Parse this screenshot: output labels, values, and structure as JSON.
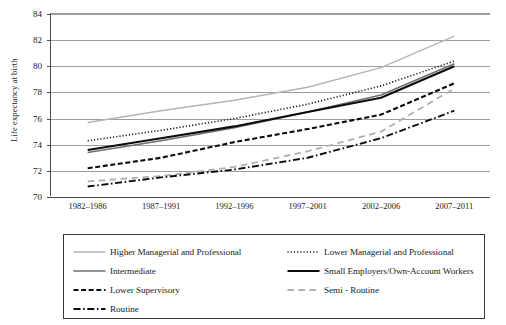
{
  "chart_data": {
    "type": "line",
    "title": "",
    "xlabel": "",
    "ylabel": "Life expectancy at birth",
    "ylim": [
      70,
      84
    ],
    "yticks": [
      70,
      72,
      74,
      76,
      78,
      80,
      82,
      84
    ],
    "grid": true,
    "legend_position": "bottom",
    "categories": [
      "1982–1986",
      "1987–1991",
      "1992–1996",
      "1997–2001",
      "2002–2006",
      "2007–2011"
    ],
    "series": [
      {
        "name": "Higher Managerial and Professional",
        "style": "solid",
        "color": "#b5b5b5",
        "width": 1.4,
        "values": [
          75.7,
          76.6,
          77.4,
          78.4,
          79.9,
          82.3
        ]
      },
      {
        "name": "Lower Managerial and Professional",
        "style": "dotted",
        "color": "#1a1a1a",
        "width": 1.6,
        "values": [
          74.3,
          75.1,
          76.0,
          77.1,
          78.5,
          80.4
        ]
      },
      {
        "name": "Intermediate",
        "style": "solid",
        "color": "#6e6e6e",
        "width": 1.6,
        "values": [
          73.4,
          74.3,
          75.3,
          76.5,
          77.8,
          80.2
        ]
      },
      {
        "name": "Small Employers/Own-Account Workers",
        "style": "solid",
        "color": "#0d0d0d",
        "width": 2.1,
        "values": [
          73.6,
          74.5,
          75.4,
          76.5,
          77.6,
          80.0
        ]
      },
      {
        "name": "Lower Supervisory",
        "style": "dashed",
        "color": "#0d0d0d",
        "width": 2.1,
        "values": [
          72.2,
          73.0,
          74.2,
          75.2,
          76.3,
          78.7
        ]
      },
      {
        "name": "Semi - Routine",
        "style": "dashed-long",
        "color": "#b0b0b0",
        "width": 1.8,
        "values": [
          71.2,
          71.6,
          72.3,
          73.5,
          75.0,
          78.3
        ]
      },
      {
        "name": "Routine",
        "style": "dash-dot",
        "color": "#0d0d0d",
        "width": 1.9,
        "values": [
          70.8,
          71.5,
          72.1,
          73.0,
          74.5,
          76.6
        ]
      }
    ]
  },
  "legend": {
    "rows": [
      [
        "Higher Managerial and Professional",
        "Lower Managerial and Professional"
      ],
      [
        "Intermediate",
        "Small Employers/Own-Account Workers"
      ],
      [
        "Lower Supervisory",
        "Semi - Routine"
      ],
      [
        "Routine",
        ""
      ]
    ]
  }
}
